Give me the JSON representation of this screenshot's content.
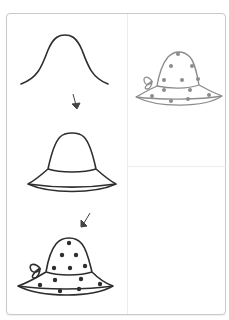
{
  "worksheet": {
    "subject": "how-to-draw-hat",
    "steps": [
      {
        "step": 1,
        "description": "crown-outline-curve"
      },
      {
        "step": 2,
        "description": "hat-with-band-and-brim"
      },
      {
        "step": 3,
        "description": "polka-dot-hat-with-bow"
      }
    ],
    "example": {
      "description": "finished-polka-dot-hat",
      "color": "#8a8a8a"
    },
    "colors": {
      "line": "#2e2e2e",
      "example_line": "#8c8c8c",
      "border": "#c9c9c9",
      "divider": "#ececec",
      "arrow": "#444444"
    }
  }
}
